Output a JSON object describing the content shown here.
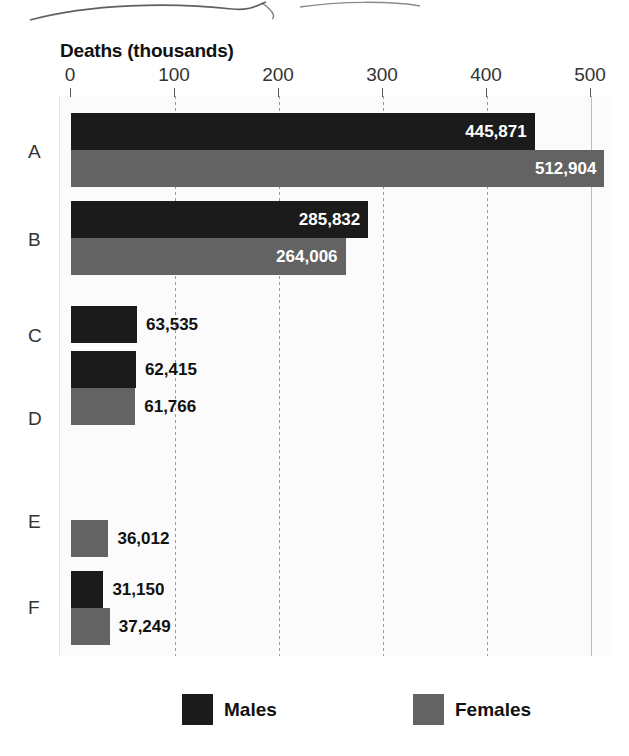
{
  "chart_data": {
    "type": "bar",
    "orientation": "horizontal",
    "title": "Deaths (thousands)",
    "xlabel": "Deaths (thousands)",
    "ylabel": "",
    "xlim": [
      0,
      500
    ],
    "xticks": [
      0,
      100,
      200,
      300,
      400,
      500
    ],
    "xtick_labels": [
      "0",
      "100",
      "200",
      "300",
      "400",
      "500"
    ],
    "grid": true,
    "legend_position": "bottom",
    "categories": [
      "A",
      "B",
      "C",
      "D",
      "E",
      "F"
    ],
    "series": [
      {
        "name": "Males",
        "color": "#1b1b1b",
        "values": [
          445871,
          285832,
          63535,
          62415,
          null,
          31150
        ],
        "value_labels": [
          "445,871",
          "285,832",
          "63,535",
          "62,415",
          "",
          "31,150"
        ]
      },
      {
        "name": "Females",
        "color": "#636363",
        "values": [
          512904,
          264006,
          null,
          61766,
          36012,
          37249
        ],
        "value_labels": [
          "512,904",
          "264,006",
          "",
          "61,766",
          "36,012",
          "37,249"
        ]
      }
    ],
    "note": "Values are raw death counts; axis is scaled in thousands."
  },
  "title": {
    "text": "Deaths (thousands)"
  },
  "axis": {
    "ticks": [
      {
        "label": "0",
        "value": 0
      },
      {
        "label": "100",
        "value": 100
      },
      {
        "label": "200",
        "value": 200
      },
      {
        "label": "300",
        "value": 300
      },
      {
        "label": "400",
        "value": 400
      },
      {
        "label": "500",
        "value": 500
      }
    ]
  },
  "categories": [
    {
      "letter": "A",
      "male": {
        "label": "445,871",
        "value": 445871,
        "inside": true
      },
      "female": {
        "label": "512,904",
        "value": 512904,
        "inside": true
      }
    },
    {
      "letter": "B",
      "male": {
        "label": "285,832",
        "value": 285832,
        "inside": true
      },
      "female": {
        "label": "264,006",
        "value": 264006,
        "inside": true
      }
    },
    {
      "letter": "C",
      "male": {
        "label": "63,535",
        "value": 63535,
        "inside": false
      },
      "female": null
    },
    {
      "letter": "D",
      "male": {
        "label": "62,415",
        "value": 62415,
        "inside": false
      },
      "female": {
        "label": "61,766",
        "value": 61766,
        "inside": false
      }
    },
    {
      "letter": "E",
      "male": null,
      "female": {
        "label": "36,012",
        "value": 36012,
        "inside": false
      }
    },
    {
      "letter": "F",
      "male": {
        "label": "31,150",
        "value": 31150,
        "inside": false
      },
      "female": {
        "label": "37,249",
        "value": 37249,
        "inside": false
      }
    }
  ],
  "legend": {
    "items": [
      {
        "label": "Males",
        "swatch": "male"
      },
      {
        "label": "Females",
        "swatch": "female"
      }
    ]
  },
  "colors": {
    "male": "#1b1b1b",
    "female": "#636363",
    "plot_background": "#fbfbfb",
    "page_background": "#ffffff",
    "gridline": "#9a9a9a",
    "text": "#111111"
  }
}
